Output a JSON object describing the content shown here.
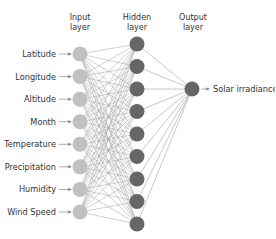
{
  "diagram": {
    "type": "neural-network",
    "layers": {
      "input": {
        "title_line1": "Input",
        "title_line2": "layer",
        "node_color": "#c0c0c0",
        "nodes": [
          "Latitude",
          "Longitude",
          "Altitude",
          "Month",
          "Temperature",
          "Precipitation",
          "Humidity",
          "Wind Speed"
        ]
      },
      "hidden": {
        "title_line1": "Hidden",
        "title_line2": "layer",
        "node_color": "#666666",
        "count": 9
      },
      "output": {
        "title_line1": "Output",
        "title_line2": "layer",
        "node_color": "#666666",
        "nodes": [
          "Solar irradiance"
        ]
      }
    },
    "edge_color": "#9a9a9a",
    "arrow_color": "#888888"
  }
}
